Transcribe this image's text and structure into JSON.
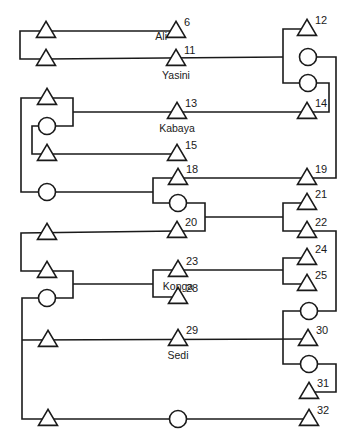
{
  "diagram": {
    "type": "kinship-chart",
    "colors": {
      "line": "#1a1a1a",
      "background": "#ffffff"
    },
    "symbols": {
      "triangle": "male",
      "circle": "female"
    },
    "nodes": [
      {
        "id": "a1",
        "shape": "triangle",
        "x": 46,
        "y": 31
      },
      {
        "id": "a2",
        "shape": "triangle",
        "x": 46,
        "y": 59
      },
      {
        "id": "n6",
        "shape": "triangle",
        "x": 176,
        "y": 31,
        "number": "6",
        "name": "Ali",
        "name_pos": "left"
      },
      {
        "id": "n11",
        "shape": "triangle",
        "x": 176,
        "y": 59,
        "number": "11",
        "name": "Yasini",
        "name_pos": "below"
      },
      {
        "id": "n12",
        "shape": "triangle",
        "x": 307,
        "y": 29,
        "number": "12"
      },
      {
        "id": "c1",
        "shape": "circle",
        "x": 308,
        "y": 57
      },
      {
        "id": "c2",
        "shape": "circle",
        "x": 308,
        "y": 83
      },
      {
        "id": "b1",
        "shape": "triangle",
        "x": 47,
        "y": 98
      },
      {
        "id": "c3",
        "shape": "circle",
        "x": 47,
        "y": 126
      },
      {
        "id": "b2",
        "shape": "triangle",
        "x": 47,
        "y": 154
      },
      {
        "id": "n13",
        "shape": "triangle",
        "x": 177,
        "y": 112,
        "number": "13",
        "name": "Kabaya",
        "name_pos": "below"
      },
      {
        "id": "n14",
        "shape": "triangle",
        "x": 307,
        "y": 112,
        "number": "14"
      },
      {
        "id": "n15",
        "shape": "triangle",
        "x": 177,
        "y": 154,
        "number": "15"
      },
      {
        "id": "c4",
        "shape": "circle",
        "x": 47,
        "y": 192
      },
      {
        "id": "n18",
        "shape": "triangle",
        "x": 178,
        "y": 178,
        "number": "18"
      },
      {
        "id": "n19",
        "shape": "triangle",
        "x": 307,
        "y": 178,
        "number": "19"
      },
      {
        "id": "c5",
        "shape": "circle",
        "x": 178,
        "y": 203
      },
      {
        "id": "n20",
        "shape": "triangle",
        "x": 177,
        "y": 231,
        "number": "20"
      },
      {
        "id": "n21",
        "shape": "triangle",
        "x": 307,
        "y": 203,
        "number": "21"
      },
      {
        "id": "n22",
        "shape": "triangle",
        "x": 307,
        "y": 231,
        "number": "22"
      },
      {
        "id": "d1",
        "shape": "triangle",
        "x": 47,
        "y": 233
      },
      {
        "id": "d2",
        "shape": "triangle",
        "x": 47,
        "y": 271
      },
      {
        "id": "c6",
        "shape": "circle",
        "x": 47,
        "y": 298
      },
      {
        "id": "n23",
        "shape": "triangle",
        "x": 178,
        "y": 270,
        "number": "23",
        "name": "Konga",
        "name_pos": "below"
      },
      {
        "id": "n28",
        "shape": "triangle",
        "x": 178,
        "y": 297,
        "number": "28"
      },
      {
        "id": "n24",
        "shape": "triangle",
        "x": 307,
        "y": 258,
        "number": "24"
      },
      {
        "id": "n25",
        "shape": "triangle",
        "x": 307,
        "y": 284,
        "number": "25"
      },
      {
        "id": "c7",
        "shape": "circle",
        "x": 309,
        "y": 311
      },
      {
        "id": "e1",
        "shape": "triangle",
        "x": 48,
        "y": 340
      },
      {
        "id": "n29",
        "shape": "triangle",
        "x": 178,
        "y": 339,
        "number": "29",
        "name": "Sedi",
        "name_pos": "below"
      },
      {
        "id": "n30",
        "shape": "triangle",
        "x": 308,
        "y": 339,
        "number": "30"
      },
      {
        "id": "c8",
        "shape": "circle",
        "x": 309,
        "y": 364
      },
      {
        "id": "n31",
        "shape": "triangle",
        "x": 309,
        "y": 392,
        "number": "31"
      },
      {
        "id": "f1",
        "shape": "triangle",
        "x": 48,
        "y": 419
      },
      {
        "id": "c9",
        "shape": "circle",
        "x": 178,
        "y": 419
      },
      {
        "id": "n32",
        "shape": "triangle",
        "x": 309,
        "y": 419,
        "number": "32"
      }
    ],
    "lines": [
      [
        [
          46,
          31
        ],
        [
          20,
          31
        ],
        [
          20,
          59
        ],
        [
          46,
          59
        ]
      ],
      [
        [
          46,
          31
        ],
        [
          176,
          31
        ]
      ],
      [
        [
          46,
          59
        ],
        [
          283,
          57
        ]
      ],
      [
        [
          307,
          29
        ],
        [
          283,
          29
        ],
        [
          283,
          83
        ],
        [
          308,
          83
        ]
      ],
      [
        [
          308,
          57
        ],
        [
          336,
          57
        ],
        [
          336,
          178
        ],
        [
          307,
          178
        ]
      ],
      [
        [
          308,
          83
        ],
        [
          329,
          83
        ],
        [
          329,
          112
        ],
        [
          307,
          112
        ]
      ],
      [
        [
          47,
          98
        ],
        [
          21,
          98
        ],
        [
          21,
          192
        ],
        [
          47,
          192
        ]
      ],
      [
        [
          47,
          98
        ],
        [
          73,
          98
        ],
        [
          73,
          126
        ],
        [
          47,
          126
        ]
      ],
      [
        [
          73,
          112
        ],
        [
          307,
          112
        ]
      ],
      [
        [
          47,
          126
        ],
        [
          32,
          126
        ],
        [
          32,
          154
        ],
        [
          177,
          154
        ]
      ],
      [
        [
          47,
          192
        ],
        [
          153,
          192
        ]
      ],
      [
        [
          178,
          178
        ],
        [
          153,
          178
        ],
        [
          153,
          203
        ],
        [
          178,
          203
        ]
      ],
      [
        [
          178,
          178
        ],
        [
          307,
          178
        ]
      ],
      [
        [
          178,
          203
        ],
        [
          205,
          203
        ],
        [
          205,
          231
        ],
        [
          177,
          231
        ]
      ],
      [
        [
          205,
          217
        ],
        [
          283,
          217
        ]
      ],
      [
        [
          307,
          203
        ],
        [
          283,
          203
        ],
        [
          283,
          231
        ],
        [
          307,
          231
        ]
      ],
      [
        [
          307,
          231
        ],
        [
          336,
          231
        ],
        [
          336,
          311
        ],
        [
          309,
          311
        ]
      ],
      [
        [
          177,
          231
        ],
        [
          21,
          233
        ],
        [
          21,
          271
        ],
        [
          47,
          271
        ]
      ],
      [
        [
          47,
          271
        ],
        [
          73,
          271
        ],
        [
          73,
          298
        ],
        [
          47,
          298
        ]
      ],
      [
        [
          73,
          284
        ],
        [
          153,
          284
        ]
      ],
      [
        [
          178,
          270
        ],
        [
          153,
          270
        ],
        [
          153,
          297
        ],
        [
          178,
          297
        ]
      ],
      [
        [
          178,
          270
        ],
        [
          283,
          270
        ]
      ],
      [
        [
          307,
          258
        ],
        [
          283,
          258
        ],
        [
          283,
          284
        ],
        [
          307,
          284
        ]
      ],
      [
        [
          309,
          311
        ],
        [
          283,
          311
        ],
        [
          283,
          364
        ],
        [
          309,
          364
        ]
      ],
      [
        [
          47,
          298
        ],
        [
          22,
          298
        ],
        [
          22,
          419
        ],
        [
          48,
          419
        ]
      ],
      [
        [
          22,
          340
        ],
        [
          308,
          339
        ]
      ],
      [
        [
          309,
          364
        ],
        [
          336,
          364
        ],
        [
          336,
          392
        ],
        [
          309,
          392
        ]
      ],
      [
        [
          48,
          419
        ],
        [
          309,
          419
        ]
      ]
    ],
    "labels": {
      "n6": "6",
      "n11": "11",
      "n12": "12",
      "n13": "13",
      "n14": "14",
      "n15": "15",
      "n18": "18",
      "n19": "19",
      "n20": "20",
      "n21": "21",
      "n22": "22",
      "n23": "23",
      "n24": "24",
      "n25": "25",
      "n28": "28",
      "n29": "29",
      "n30": "30",
      "n31": "31",
      "n32": "32"
    },
    "names": {
      "ali": "Ali",
      "yasini": "Yasini",
      "kabaya": "Kabaya",
      "konga": "Konga",
      "sedi": "Sedi"
    }
  }
}
